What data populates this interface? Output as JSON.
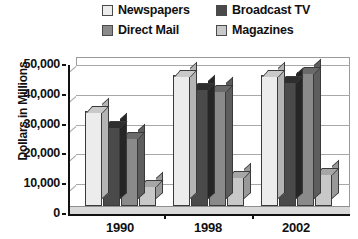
{
  "chart_data": {
    "type": "bar",
    "title": "",
    "subtitle": "",
    "xlabel": "",
    "ylabel": "Dollars in Millions",
    "categories": [
      "1990",
      "1998",
      "2002"
    ],
    "ylim": [
      0,
      50000
    ],
    "y_ticks": [
      0,
      10000,
      20000,
      30000,
      40000,
      50000
    ],
    "y_tick_labels": [
      "0",
      "10,000",
      "20,000",
      "30,000",
      "40,000",
      "50,000"
    ],
    "grid": true,
    "legend_position": "top",
    "three_d": true,
    "series": [
      {
        "name": "Newspapers",
        "color": "#ececec",
        "top_color": "#c9c9c9",
        "side_color": "#b4b4b4",
        "values": [
          32000,
          44000,
          44000
        ]
      },
      {
        "name": "Broadcast TV",
        "color": "#4a4a4a",
        "top_color": "#2e2e2e",
        "side_color": "#262626",
        "values": [
          27000,
          39500,
          42000
        ]
      },
      {
        "name": "Direct Mail",
        "color": "#8a8a8a",
        "top_color": "#6a6a6a",
        "side_color": "#5d5d5d",
        "values": [
          23000,
          39000,
          45000
        ]
      },
      {
        "name": "Magazines",
        "color": "#c8c8c8",
        "top_color": "#a6a6a6",
        "side_color": "#999999",
        "values": [
          7000,
          10000,
          11000
        ]
      }
    ]
  },
  "legend": {
    "items": [
      {
        "label": "Newspapers",
        "swatch": "#ececec"
      },
      {
        "label": "Broadcast TV",
        "swatch": "#4a4a4a"
      },
      {
        "label": "Direct Mail",
        "swatch": "#8a8a8a"
      },
      {
        "label": "Magazines",
        "swatch": "#c8c8c8"
      }
    ]
  },
  "axis": {
    "y_title": "Dollars in Millions"
  },
  "theme": {
    "background": "#ffffff",
    "axis_color": "#111111",
    "grid_color": "#a8a8a8",
    "frame_color": "#9a9a9a",
    "floor_color": "#d9d9d9",
    "bar_outline": "#3a3a3a",
    "text_color": "#111111"
  }
}
